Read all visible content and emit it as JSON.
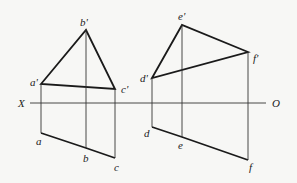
{
  "axis": {
    "left_label": "X",
    "right_label": "O"
  },
  "figure_left": {
    "labels": {
      "a_prime": "a'",
      "b_prime": "b'",
      "c_prime": "c'",
      "a": "a",
      "b": "b",
      "c": "c"
    }
  },
  "figure_right": {
    "labels": {
      "d_prime": "d'",
      "e_prime": "e'",
      "f_prime": "f'",
      "d": "d",
      "e": "e",
      "f": "f"
    }
  }
}
